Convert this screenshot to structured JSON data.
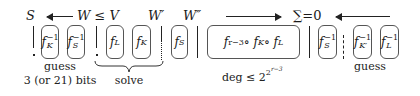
{
  "top_labels": {
    "s": "S",
    "w_le_v": "W ≤ V",
    "w_prime": "W′",
    "w_double_prime": "W″",
    "sum_zero": "∑=0"
  },
  "boxes": [
    {
      "base": "f",
      "sup": "−1",
      "sub": "K"
    },
    {
      "base": "f",
      "sup": "−1",
      "sub": "S"
    },
    {
      "base": "f",
      "sup": "",
      "sub": "L"
    },
    {
      "base": "f",
      "sup": "",
      "sub": "K"
    },
    {
      "base": "f",
      "sup": "",
      "sub": "S"
    },
    {
      "base": "f",
      "sup": "r−3",
      "middle": " ∘ f",
      "sub1": "K",
      "tail": " ∘ f",
      "sub2": "L"
    },
    {
      "base": "f",
      "sup": "−1",
      "sub": "S"
    },
    {
      "base": "f",
      "sup": "−1",
      "sub": "K′"
    },
    {
      "base": "f",
      "sup": "−1",
      "sub": "L"
    }
  ],
  "captions": {
    "guess_left_line1": "guess",
    "guess_left_line2": "3 (or 21) bits",
    "solve": "solve",
    "deg_prefix": "deg ≤ 2",
    "deg_exp": "2",
    "deg_exp2": "r−3",
    "guess_right": "guess"
  },
  "separators": [
    {
      "x": 33,
      "style": "solid-gap"
    },
    {
      "x": 96,
      "style": "solid-gap"
    },
    {
      "x": 161,
      "style": "dotted"
    },
    {
      "x": 197,
      "style": "solid"
    },
    {
      "x": 309,
      "style": "solid"
    },
    {
      "x": 343,
      "style": "dashed"
    }
  ]
}
